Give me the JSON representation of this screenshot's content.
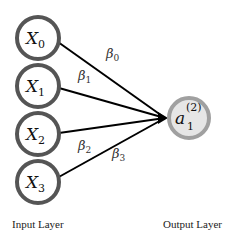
{
  "diagram": {
    "title": "",
    "input_layer": {
      "label": "Input Layer",
      "nodes": [
        {
          "var": "X",
          "sub": "0"
        },
        {
          "var": "X",
          "sub": "1"
        },
        {
          "var": "X",
          "sub": "2"
        },
        {
          "var": "X",
          "sub": "3"
        }
      ]
    },
    "output_layer": {
      "label": "Output Layer",
      "node": {
        "var": "a",
        "sub": "1",
        "sup": "(2)"
      }
    },
    "weights": [
      {
        "var": "β",
        "sub": "0"
      },
      {
        "var": "β",
        "sub": "1"
      },
      {
        "var": "β",
        "sub": "2"
      },
      {
        "var": "β",
        "sub": "3"
      }
    ],
    "colors": {
      "input_stroke": "#555555",
      "input_fill": "#ffffff",
      "output_stroke": "#a0a0a0",
      "output_fill": "#e6e6e6",
      "edge": "#000000"
    }
  }
}
